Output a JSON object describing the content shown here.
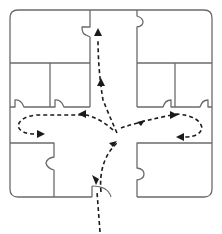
{
  "diagram": {
    "type": "floor-plan-traffic-flow",
    "colors": {
      "wall": "#6b6b6b",
      "path": "#1a1a1a",
      "background": "#ffffff"
    },
    "rooms": [
      {
        "id": "top-left-large"
      },
      {
        "id": "left-middle-1"
      },
      {
        "id": "left-middle-2"
      },
      {
        "id": "top-right-large"
      },
      {
        "id": "right-middle-1"
      },
      {
        "id": "right-middle-2"
      },
      {
        "id": "bottom-left"
      },
      {
        "id": "bottom-right"
      }
    ],
    "paths": [
      {
        "id": "entry",
        "description": "enters from bottom through main door"
      },
      {
        "id": "to-top-corridor",
        "description": "up the central corridor to top"
      },
      {
        "id": "to-left-wing",
        "description": "loops into left hallway"
      },
      {
        "id": "to-right-wing",
        "description": "loops into right hallway"
      }
    ]
  }
}
